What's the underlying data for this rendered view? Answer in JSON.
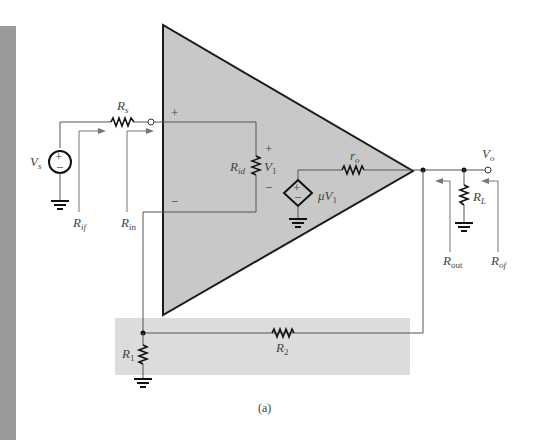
{
  "figure": {
    "caption": "(a)",
    "colors": {
      "side_bar": "#9a9a9a",
      "opamp_fill": "#c8c8c8",
      "opamp_outline": "#1a1a1a",
      "feedback_region": "#dcdcdc",
      "wire": "#555555",
      "label_text": "#444444"
    }
  },
  "source": {
    "label": "V",
    "subscript": "s",
    "polarity_plus": "+",
    "polarity_minus": "−"
  },
  "source_resistor": {
    "label": "R",
    "subscript": "s"
  },
  "input_terminal": {
    "plus": "+",
    "minus": "−"
  },
  "input_resistance": {
    "label": "R",
    "subscript": "id"
  },
  "input_voltage": {
    "label": "V",
    "subscript": "1",
    "plus": "+",
    "minus": "−"
  },
  "dependent_source": {
    "gain_label": "μV",
    "gain_subscript": "1",
    "plus": "+",
    "minus": "−"
  },
  "output_resistance": {
    "label": "r",
    "subscript": "o"
  },
  "output_node": {
    "label": "V",
    "subscript": "o"
  },
  "load_resistor": {
    "label": "R",
    "subscript": "L"
  },
  "feedback": {
    "r1": {
      "label": "R",
      "subscript": "1"
    },
    "r2": {
      "label": "R",
      "subscript": "2"
    }
  },
  "measurements": {
    "r_if": {
      "label": "R",
      "subscript": "if"
    },
    "r_in": {
      "label": "R",
      "subscript": "in"
    },
    "r_out": {
      "label": "R",
      "subscript": "out"
    },
    "r_of": {
      "label": "R",
      "subscript": "of"
    }
  }
}
